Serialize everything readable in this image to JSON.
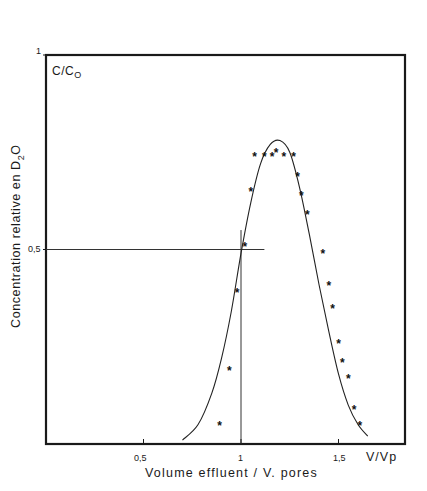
{
  "header": {
    "faint_title": ""
  },
  "axes": {
    "y_label_main": "Concentration relative en ",
    "y_label_species": "D",
    "y_label_sub": "2",
    "y_label_tail": "O",
    "corner_label_main": "C/C",
    "corner_label_sub": "O",
    "y_ticks": [
      {
        "label": "1",
        "value": 1
      },
      {
        "label": "0,5",
        "value": 0.5
      }
    ],
    "x_ticks": [
      {
        "label": "0,5",
        "value": 0.5
      },
      {
        "label": "1",
        "value": 1
      },
      {
        "label": "1,5",
        "value": 1.5
      }
    ],
    "x_unit": "V/Vp",
    "x_label": "Volume effluent / V. pores"
  },
  "chart_data": {
    "type": "scatter",
    "title": "",
    "xlabel": "Volume effluent / V. pores (V/Vp)",
    "ylabel": "Concentration relative en D2O (C/Co)",
    "xlim": [
      0,
      1.85
    ],
    "ylim": [
      0,
      1.0
    ],
    "x_ticks": [
      0.5,
      1,
      1.5
    ],
    "y_ticks": [
      0.5,
      1
    ],
    "grid": false,
    "legend": null,
    "series": [
      {
        "name": "Mesures (points)",
        "type": "scatter",
        "marker": "*",
        "x": [
          0.89,
          0.94,
          0.98,
          1.02,
          1.05,
          1.07,
          1.12,
          1.16,
          1.18,
          1.22,
          1.27,
          1.29,
          1.31,
          1.34,
          1.42,
          1.45,
          1.47,
          1.5,
          1.52,
          1.55,
          1.58,
          1.61
        ],
        "y": [
          0.05,
          0.19,
          0.39,
          0.51,
          0.65,
          0.74,
          0.74,
          0.74,
          0.75,
          0.74,
          0.74,
          0.69,
          0.64,
          0.59,
          0.49,
          0.41,
          0.35,
          0.26,
          0.21,
          0.17,
          0.09,
          0.05
        ]
      },
      {
        "name": "Courbe théorique",
        "type": "line",
        "x": [
          0.7,
          0.78,
          0.85,
          0.9,
          0.95,
          1.0,
          1.05,
          1.1,
          1.15,
          1.2,
          1.25,
          1.3,
          1.35,
          1.4,
          1.45,
          1.5,
          1.55,
          1.6,
          1.65
        ],
        "y": [
          0.01,
          0.05,
          0.13,
          0.22,
          0.34,
          0.49,
          0.62,
          0.72,
          0.77,
          0.78,
          0.75,
          0.66,
          0.54,
          0.41,
          0.29,
          0.18,
          0.1,
          0.05,
          0.02
        ]
      }
    ],
    "annotations": [
      {
        "type": "hline",
        "y": 0.5,
        "x_from": 0,
        "x_to": 1.12,
        "note": "C/Co = 0,5 reference line"
      },
      {
        "type": "vline",
        "x": 1.0,
        "y_from": 0,
        "y_to": 0.55,
        "note": "V/Vp = 1 reference line"
      }
    ]
  }
}
